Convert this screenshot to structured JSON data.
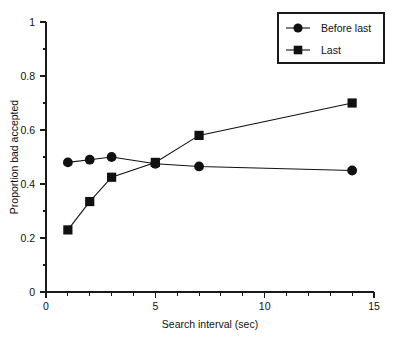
{
  "chart_data": {
    "type": "line",
    "title": "",
    "xlabel": "Search interval (sec)",
    "ylabel": "Proportion bad accepted",
    "xlim": [
      0,
      15
    ],
    "ylim": [
      0,
      1
    ],
    "grid": false,
    "legend_position": "top-right",
    "x_ticks": [
      {
        "value": 0,
        "label": "0"
      },
      {
        "value": 5,
        "label": "5"
      },
      {
        "value": 10,
        "label": "10"
      },
      {
        "value": 15,
        "label": "15"
      }
    ],
    "x_minor_ticks": [
      1,
      2,
      3,
      4,
      6,
      7,
      8,
      9,
      11,
      12,
      13,
      14
    ],
    "y_ticks": [
      {
        "value": 0,
        "label": "0"
      },
      {
        "value": 0.2,
        "label": "0.2"
      },
      {
        "value": 0.4,
        "label": "0.4"
      },
      {
        "value": 0.6,
        "label": "0.6"
      },
      {
        "value": 0.8,
        "label": "0.8"
      },
      {
        "value": 1,
        "label": "1"
      }
    ],
    "y_minor_ticks": [
      0.1,
      0.3,
      0.5,
      0.7,
      0.9
    ],
    "x": [
      1,
      2,
      3,
      5,
      7,
      14
    ],
    "series": [
      {
        "name": "Before last",
        "marker": "circle",
        "values": [
          0.48,
          0.49,
          0.5,
          0.475,
          0.465,
          0.45
        ]
      },
      {
        "name": "Last",
        "marker": "square",
        "values": [
          0.23,
          0.335,
          0.425,
          0.48,
          0.58,
          0.7
        ]
      }
    ]
  },
  "legend": {
    "entries": [
      {
        "label": "Before last",
        "marker": "circle"
      },
      {
        "label": "Last",
        "marker": "square"
      }
    ]
  }
}
